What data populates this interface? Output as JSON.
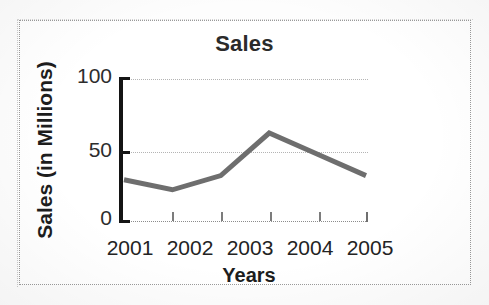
{
  "figure": {
    "title": "Sales",
    "x_axis_title": "Years",
    "y_axis_title": "Sales (in Millions)",
    "border_style": "dotted",
    "colors": {
      "series_line": "#6e6e6e",
      "axis": "#141414",
      "gridline": "#b4b4b4",
      "text": "#232323",
      "background": "#ffffff"
    }
  },
  "chart_data": {
    "type": "line",
    "title": "Sales",
    "xlabel": "Years",
    "ylabel": "Sales (in Millions)",
    "categories": [
      "2001",
      "2002",
      "2003",
      "2004",
      "2005"
    ],
    "values": [
      29,
      22,
      32,
      62,
      47
    ],
    "series": [
      {
        "name": "Sales",
        "values": [
          29,
          22,
          32,
          62,
          47
        ]
      }
    ],
    "ylim": [
      0,
      100
    ],
    "yticks": [
      0,
      50,
      100
    ],
    "ytick_labels": [
      "0",
      "50",
      "100"
    ],
    "xticks": [
      "2001",
      "2002",
      "2003",
      "2004",
      "2005"
    ],
    "grid": true,
    "grid_axis": "y",
    "grid_style": "dotted",
    "legend": false,
    "legend_position": "none",
    "markers": false,
    "line_color": "#6e6e6e",
    "line_width": 5,
    "annotations": []
  },
  "y_ticks": [
    {
      "label": "100",
      "value": 100
    },
    {
      "label": "50",
      "value": 50
    },
    {
      "label": "0",
      "value": 0
    }
  ]
}
